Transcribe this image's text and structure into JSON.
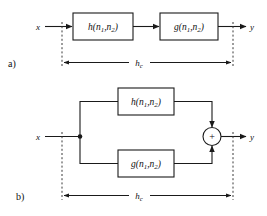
{
  "figure": {
    "panels": [
      {
        "tag": "a)",
        "topology": "cascade",
        "input_label": "x",
        "output_label": "y",
        "blocks": [
          {
            "name": "h",
            "arg1": "n",
            "arg1_sub": "1",
            "arg2": "n",
            "arg2_sub": "2",
            "full": "h(n1,n2)"
          },
          {
            "name": "g",
            "arg1": "n",
            "arg1_sub": "1",
            "arg2": "n",
            "arg2_sub": "2",
            "full": "g(n1,n2)"
          }
        ],
        "dimension": {
          "label": "h",
          "label_sub": "c",
          "full": "hc"
        }
      },
      {
        "tag": "b)",
        "topology": "parallel",
        "input_label": "x",
        "output_label": "y",
        "blocks": [
          {
            "name": "h",
            "arg1": "n",
            "arg1_sub": "1",
            "arg2": "n",
            "arg2_sub": "2",
            "full": "h(n1,n2)"
          },
          {
            "name": "g",
            "arg1": "n",
            "arg1_sub": "1",
            "arg2": "n",
            "arg2_sub": "2",
            "full": "g(n1,n2)"
          }
        ],
        "adder": {
          "symbol": "+",
          "name": "summing-junction"
        },
        "dimension": {
          "label": "h",
          "label_sub": "c",
          "full": "hc"
        }
      }
    ],
    "colors": {
      "line": "#1a1a1a",
      "guide": "#3a3a3a",
      "background": "#ffffff"
    }
  }
}
